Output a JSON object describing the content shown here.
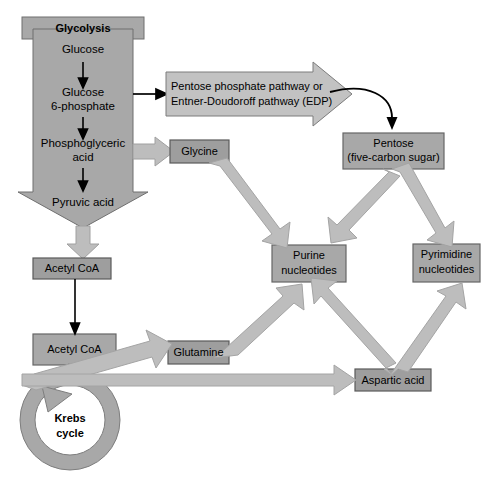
{
  "diagram": {
    "colors": {
      "box_fill": "#9a9a9a",
      "box_stroke": "#555555",
      "big_arrow_fill": "#a8a8a8",
      "big_arrow_stroke": "#7c7c7c",
      "pale_arrow_fill": "#b9b9b9",
      "pale_arrow_stroke": "#9c9c9c",
      "thin_arrow": "#000000",
      "text": "#000000",
      "background": "#ffffff"
    },
    "nodes": {
      "glycolysis_header": "Glycolysis",
      "glucose": "Glucose",
      "glucose_6_phosphate_line1": "Glucose",
      "glucose_6_phosphate_line2": "6-phosphate",
      "phosphoglyceric_acid_line1": "Phosphoglyceric",
      "phosphoglyceric_acid_line2": "acid",
      "pyruvic_acid": "Pyruvic acid",
      "ppp_line1": "Pentose phosphate pathway or",
      "ppp_line2": "Entner-Doudoroff pathway (EDP)",
      "pentose_line1": "Pentose",
      "pentose_line2": "(five-carbon sugar)",
      "glycine": "Glycine",
      "purine_line1": "Purine",
      "purine_line2": "nucleotides",
      "pyrimidine_line1": "Pyrimidine",
      "pyrimidine_line2": "nucleotides",
      "acetyl_coa_1": "Acetyl CoA",
      "acetyl_coa_2": "Acetyl CoA",
      "glutamine": "Glutamine",
      "aspartic_acid": "Aspartic acid",
      "krebs_line1": "Krebs",
      "krebs_line2": "cycle"
    },
    "edges": [
      {
        "from": "glucose",
        "to": "glucose-6-phosphate",
        "style": "thin-black-down"
      },
      {
        "from": "glucose-6-phosphate",
        "to": "phosphoglyceric-acid",
        "style": "thin-black-down"
      },
      {
        "from": "phosphoglyceric-acid",
        "to": "pyruvic-acid",
        "style": "thin-black-down"
      },
      {
        "from": "glucose-6-phosphate",
        "to": "pentose-phosphate-pathway",
        "style": "thin-black-right"
      },
      {
        "from": "pentose-phosphate-pathway",
        "to": "pentose",
        "style": "thin-black-curve"
      },
      {
        "from": "phosphoglyceric-acid",
        "to": "glycine",
        "style": "thick-grey-right"
      },
      {
        "from": "glycolysis",
        "to": "acetyl-coa-1",
        "style": "thick-grey-down"
      },
      {
        "from": "acetyl-coa-1",
        "to": "acetyl-coa-2",
        "style": "thin-black-down"
      },
      {
        "from": "glycine",
        "to": "purine-nucleotides",
        "style": "thick-grey-diagonal"
      },
      {
        "from": "pentose",
        "to": "purine-nucleotides",
        "style": "thick-grey-diagonal"
      },
      {
        "from": "pentose",
        "to": "pyrimidine-nucleotides",
        "style": "thick-grey-diagonal"
      },
      {
        "from": "glutamine",
        "to": "purine-nucleotides",
        "style": "thick-grey-diagonal"
      },
      {
        "from": "aspartic-acid",
        "to": "purine-nucleotides",
        "style": "thick-grey-diagonal"
      },
      {
        "from": "aspartic-acid",
        "to": "pyrimidine-nucleotides",
        "style": "thick-grey-diagonal"
      },
      {
        "from": "krebs-cycle",
        "to": "glutamine",
        "style": "thick-grey-diagonal"
      },
      {
        "from": "krebs-cycle",
        "to": "aspartic-acid",
        "style": "thick-grey-right"
      }
    ]
  }
}
